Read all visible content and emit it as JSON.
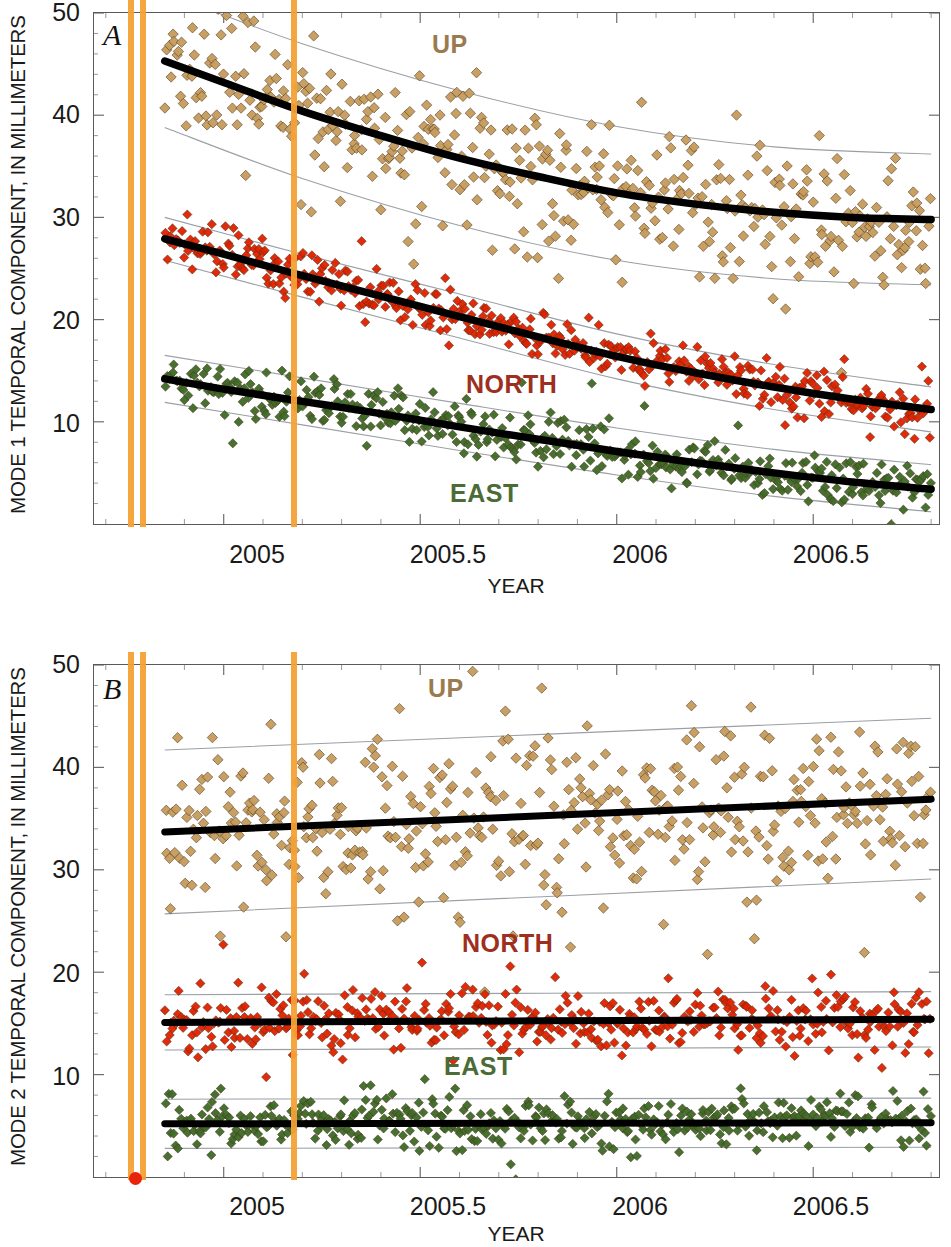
{
  "figure": {
    "xtitle": "YEAR",
    "xticks": [
      "2005",
      "2005.5",
      "2006",
      "2006.5"
    ],
    "xtick_values": [
      2005,
      2005.5,
      2006,
      2006.5
    ],
    "yticks": [
      "10",
      "20",
      "30",
      "40",
      "50"
    ],
    "ytick_values": [
      10,
      20,
      30,
      40,
      50
    ],
    "colors": {
      "up": "#c69c5d",
      "north": "#e02200",
      "east": "#3e6b28",
      "fit": "#000000",
      "band": "#9aa0a6",
      "event_line": "#f6a135",
      "event_dot": "#e8240c",
      "axis": "#5a5a5a"
    }
  },
  "panelA": {
    "letter": "A",
    "ytitle": "MODE 1 TEMPORAL COMPONENT, IN MILLIMETERS",
    "labels": {
      "up": "UP",
      "north": "NORTH",
      "east": "EAST"
    }
  },
  "panelB": {
    "letter": "B",
    "ytitle": "MODE 2 TEMPORAL COMPONENT, IN MILLIMETERS",
    "labels": {
      "up": "UP",
      "north": "NORTH",
      "east": "EAST"
    }
  },
  "chart_data": [
    {
      "type": "scatter",
      "panel": "A",
      "title": "",
      "xlabel": "YEAR",
      "ylabel": "MODE 1 TEMPORAL COMPONENT, IN MILLIMETERS",
      "xlim": [
        2004.67,
        2006.82
      ],
      "ylim": [
        0,
        50
      ],
      "grid": false,
      "legend": "inline-annotations",
      "annotations": [
        {
          "text": "A",
          "x": 2004.73,
          "y": 47.5
        },
        {
          "text": "UP",
          "x": 2005.45,
          "y": 46.5
        },
        {
          "text": "NORTH",
          "x": 2005.55,
          "y": 12.8
        },
        {
          "text": "EAST",
          "x": 2005.5,
          "y": 3.2
        }
      ],
      "event_lines": [
        2004.765,
        2004.795,
        2005.18
      ],
      "series": [
        {
          "name": "UP",
          "color": "#c69c5d",
          "marker": "diamond",
          "fit_type": "exponential-decay",
          "fit_points": [
            {
              "x": 2004.85,
              "y": 45.3
            },
            {
              "x": 2005.0,
              "y": 43.2
            },
            {
              "x": 2005.2,
              "y": 40.4
            },
            {
              "x": 2005.4,
              "y": 38.0
            },
            {
              "x": 2005.6,
              "y": 35.8
            },
            {
              "x": 2005.8,
              "y": 34.0
            },
            {
              "x": 2006.0,
              "y": 32.4
            },
            {
              "x": 2006.2,
              "y": 31.3
            },
            {
              "x": 2006.4,
              "y": 30.5
            },
            {
              "x": 2006.6,
              "y": 30.0
            },
            {
              "x": 2006.8,
              "y": 29.8
            }
          ],
          "band_upper": [
            {
              "x": 2004.85,
              "y": 52.0
            },
            {
              "x": 2005.2,
              "y": 47.0
            },
            {
              "x": 2005.6,
              "y": 42.4
            },
            {
              "x": 2006.0,
              "y": 38.9
            },
            {
              "x": 2006.4,
              "y": 36.9
            },
            {
              "x": 2006.8,
              "y": 36.2
            }
          ],
          "band_lower": [
            {
              "x": 2004.85,
              "y": 38.8
            },
            {
              "x": 2005.2,
              "y": 33.8
            },
            {
              "x": 2005.6,
              "y": 29.2
            },
            {
              "x": 2006.0,
              "y": 25.8
            },
            {
              "x": 2006.4,
              "y": 24.0
            },
            {
              "x": 2006.8,
              "y": 23.4
            }
          ],
          "scatter_spread": 3.6,
          "n_points": 420
        },
        {
          "name": "NORTH",
          "color": "#e02200",
          "marker": "diamond",
          "fit_type": "exponential-decay",
          "fit_points": [
            {
              "x": 2004.85,
              "y": 27.9
            },
            {
              "x": 2005.0,
              "y": 26.4
            },
            {
              "x": 2005.2,
              "y": 24.3
            },
            {
              "x": 2005.4,
              "y": 22.3
            },
            {
              "x": 2005.6,
              "y": 20.3
            },
            {
              "x": 2005.8,
              "y": 18.3
            },
            {
              "x": 2006.0,
              "y": 16.4
            },
            {
              "x": 2006.2,
              "y": 14.8
            },
            {
              "x": 2006.4,
              "y": 13.4
            },
            {
              "x": 2006.6,
              "y": 12.2
            },
            {
              "x": 2006.8,
              "y": 11.2
            }
          ],
          "band_upper": [
            {
              "x": 2004.85,
              "y": 30.0
            },
            {
              "x": 2005.2,
              "y": 26.4
            },
            {
              "x": 2005.6,
              "y": 22.5
            },
            {
              "x": 2006.0,
              "y": 18.6
            },
            {
              "x": 2006.4,
              "y": 15.6
            },
            {
              "x": 2006.8,
              "y": 13.4
            }
          ],
          "band_lower": [
            {
              "x": 2004.85,
              "y": 25.8
            },
            {
              "x": 2005.2,
              "y": 22.2
            },
            {
              "x": 2005.6,
              "y": 18.2
            },
            {
              "x": 2006.0,
              "y": 14.2
            },
            {
              "x": 2006.4,
              "y": 11.2
            },
            {
              "x": 2006.8,
              "y": 9.0
            }
          ],
          "scatter_spread": 1.25,
          "n_points": 430
        },
        {
          "name": "EAST",
          "color": "#3e6b28",
          "marker": "diamond",
          "fit_type": "exponential-decay",
          "fit_points": [
            {
              "x": 2004.85,
              "y": 14.2
            },
            {
              "x": 2005.0,
              "y": 13.2
            },
            {
              "x": 2005.2,
              "y": 12.0
            },
            {
              "x": 2005.4,
              "y": 10.8
            },
            {
              "x": 2005.6,
              "y": 9.5
            },
            {
              "x": 2005.8,
              "y": 8.3
            },
            {
              "x": 2006.0,
              "y": 7.1
            },
            {
              "x": 2006.2,
              "y": 6.0
            },
            {
              "x": 2006.4,
              "y": 5.0
            },
            {
              "x": 2006.6,
              "y": 4.1
            },
            {
              "x": 2006.8,
              "y": 3.4
            }
          ],
          "band_upper": [
            {
              "x": 2004.85,
              "y": 16.5
            },
            {
              "x": 2005.2,
              "y": 14.3
            },
            {
              "x": 2005.6,
              "y": 11.8
            },
            {
              "x": 2006.0,
              "y": 9.4
            },
            {
              "x": 2006.4,
              "y": 7.3
            },
            {
              "x": 2006.8,
              "y": 5.8
            }
          ],
          "band_lower": [
            {
              "x": 2004.85,
              "y": 11.9
            },
            {
              "x": 2005.2,
              "y": 9.7
            },
            {
              "x": 2005.6,
              "y": 7.2
            },
            {
              "x": 2006.0,
              "y": 4.8
            },
            {
              "x": 2006.4,
              "y": 2.7
            },
            {
              "x": 2006.8,
              "y": 1.2
            }
          ],
          "scatter_spread": 1.2,
          "n_points": 430
        }
      ]
    },
    {
      "type": "scatter",
      "panel": "B",
      "title": "",
      "xlabel": "YEAR",
      "ylabel": "MODE 2 TEMPORAL COMPONENT, IN MILLIMETERS",
      "xlim": [
        2004.67,
        2006.82
      ],
      "ylim": [
        0,
        50
      ],
      "grid": false,
      "legend": "inline-annotations",
      "annotations": [
        {
          "text": "B",
          "x": 2004.73,
          "y": 47.5
        },
        {
          "text": "UP",
          "x": 2005.42,
          "y": 45.5
        },
        {
          "text": "NORTH",
          "x": 2005.58,
          "y": 22.3
        },
        {
          "text": "EAST",
          "x": 2005.52,
          "y": 10.6
        }
      ],
      "event_lines": [
        2004.765,
        2004.795,
        2005.18
      ],
      "event_dot": {
        "x": 2004.775,
        "y": 0
      },
      "series": [
        {
          "name": "UP",
          "color": "#c69c5d",
          "marker": "diamond",
          "fit_type": "linear",
          "fit_points": [
            {
              "x": 2004.85,
              "y": 33.7
            },
            {
              "x": 2006.8,
              "y": 36.9
            }
          ],
          "band_upper": [
            {
              "x": 2004.85,
              "y": 41.7
            },
            {
              "x": 2006.8,
              "y": 44.8
            }
          ],
          "band_lower": [
            {
              "x": 2004.85,
              "y": 25.7
            },
            {
              "x": 2006.8,
              "y": 29.1
            }
          ],
          "scatter_spread": 4.3,
          "n_points": 430
        },
        {
          "name": "NORTH",
          "color": "#e02200",
          "marker": "diamond",
          "fit_type": "linear",
          "fit_points": [
            {
              "x": 2004.85,
              "y": 15.1
            },
            {
              "x": 2006.8,
              "y": 15.4
            }
          ],
          "band_upper": [
            {
              "x": 2004.85,
              "y": 17.8
            },
            {
              "x": 2006.8,
              "y": 18.1
            }
          ],
          "band_lower": [
            {
              "x": 2004.85,
              "y": 12.4
            },
            {
              "x": 2006.8,
              "y": 12.7
            }
          ],
          "scatter_spread": 1.5,
          "n_points": 440
        },
        {
          "name": "EAST",
          "color": "#3e6b28",
          "marker": "diamond",
          "fit_type": "linear",
          "fit_points": [
            {
              "x": 2004.85,
              "y": 5.2
            },
            {
              "x": 2006.8,
              "y": 5.3
            }
          ],
          "band_upper": [
            {
              "x": 2004.85,
              "y": 7.6
            },
            {
              "x": 2006.8,
              "y": 7.7
            }
          ],
          "band_lower": [
            {
              "x": 2004.85,
              "y": 2.8
            },
            {
              "x": 2006.8,
              "y": 2.9
            }
          ],
          "scatter_spread": 1.35,
          "n_points": 440
        }
      ]
    }
  ]
}
